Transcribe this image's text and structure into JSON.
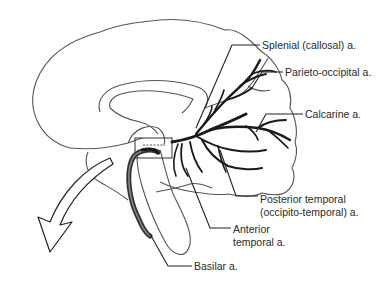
{
  "diagram": {
    "colors": {
      "outline": "#555555",
      "artery": "#1a1a1a",
      "basilar": "#444444",
      "text": "#2a2a2a",
      "background": "#ffffff"
    },
    "labels": {
      "splenial": "Splenial (callosal) a.",
      "parieto_occipital": "Parieto-occipital a.",
      "calcarine": "Calcarine a.",
      "posterior_temporal_line1": "Posterior temporal",
      "posterior_temporal_line2": "(occipito-temporal) a.",
      "anterior_temporal_line1": "Anterior",
      "anterior_temporal_line2": "temporal a.",
      "basilar": "Basilar a."
    }
  }
}
